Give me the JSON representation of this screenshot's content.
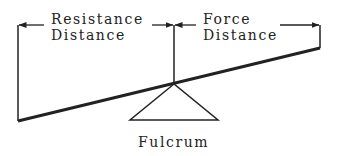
{
  "diagram": {
    "labels": {
      "resistance_line1": "Resistance",
      "resistance_line2": "Distance",
      "force_line1": "Force",
      "force_line2": "Distance",
      "fulcrum": "Fulcrum"
    },
    "colors": {
      "ink": "#222222",
      "background": "#ffffff"
    },
    "elements": [
      {
        "id": "beam",
        "type": "line",
        "description": "Lever beam sloping up to the right"
      },
      {
        "id": "fulcrum",
        "type": "triangle",
        "description": "Fulcrum supporting the beam"
      },
      {
        "id": "resistance-distance",
        "type": "dimension-arrow",
        "description": "Resistance Distance span from left end to fulcrum"
      },
      {
        "id": "force-distance",
        "type": "dimension-arrow",
        "description": "Force Distance span from fulcrum to right end"
      }
    ]
  }
}
